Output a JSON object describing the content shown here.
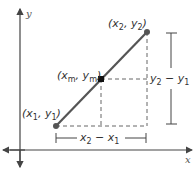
{
  "diagram": {
    "type": "midpoint-on-coordinate-plane",
    "axes": {
      "x_label": "x",
      "y_label": "y"
    },
    "points": [
      {
        "id": "p1",
        "label": "(x",
        "sub1": "1",
        "sep": ", y",
        "sub2": "1",
        "close": ")",
        "plain": "(x1, y1)"
      },
      {
        "id": "pm",
        "label": "(x",
        "sub1": "m",
        "sep": ", y",
        "sub2": "m",
        "close": ")",
        "plain": "(xm, ym)"
      },
      {
        "id": "p2",
        "label": "(x",
        "sub1": "2",
        "sep": ", y",
        "sub2": "2",
        "close": ")",
        "plain": "(x2, y2)"
      }
    ],
    "dimensions": {
      "horizontal": {
        "a": "x",
        "a_sub": "2",
        "op": " − ",
        "b": "x",
        "b_sub": "1",
        "plain": "x2 − x1"
      },
      "vertical": {
        "a": "y",
        "a_sub": "2",
        "op": " − ",
        "b": "y",
        "b_sub": "1",
        "plain": "y2 − y1"
      }
    },
    "colors": {
      "segment": "#555555",
      "points": "#333333",
      "axes": "#444444",
      "dashed": "#666666"
    }
  }
}
